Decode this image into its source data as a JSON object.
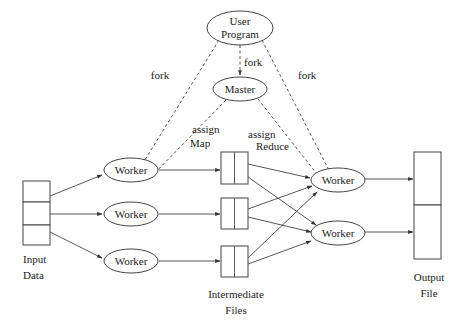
{
  "diagram": {
    "nodes": {
      "user_program": {
        "line1": "User",
        "line2": "Program"
      },
      "master": {
        "label": "Master"
      },
      "map_workers": [
        {
          "label": "Worker"
        },
        {
          "label": "Worker"
        },
        {
          "label": "Worker"
        }
      ],
      "reduce_workers": [
        {
          "label": "Worker"
        },
        {
          "label": "Worker"
        }
      ],
      "input": {
        "line1": "Input",
        "line2": "Data",
        "splits": 3
      },
      "intermediate": {
        "line1": "Intermediate",
        "line2": "Files",
        "files": 3,
        "partitions_per_file": 2
      },
      "output": {
        "line1": "Output",
        "line2": "File",
        "parts": 2
      }
    },
    "edge_labels": {
      "fork_left": "fork",
      "fork_center": "fork",
      "fork_right": "fork",
      "assign_map_1": "assign",
      "assign_map_2": "Map",
      "assign_reduce_1": "assign",
      "assign_reduce_2": "Reduce"
    },
    "edges": [
      {
        "from": "user_program",
        "to": "master",
        "style": "dashed",
        "label": "fork"
      },
      {
        "from": "user_program",
        "to": "map_worker_1",
        "style": "dashed",
        "label": "fork"
      },
      {
        "from": "user_program",
        "to": "reduce_worker_1",
        "style": "dashed",
        "label": "fork"
      },
      {
        "from": "master",
        "to": "map_worker_1",
        "style": "dashed",
        "label": "assign Map"
      },
      {
        "from": "master",
        "to": "reduce_worker_1",
        "style": "dashed",
        "label": "assign Reduce"
      },
      {
        "from": "input_split_1",
        "to": "map_worker_1",
        "style": "solid"
      },
      {
        "from": "input_split_2",
        "to": "map_worker_2",
        "style": "solid"
      },
      {
        "from": "input_split_3",
        "to": "map_worker_3",
        "style": "solid"
      },
      {
        "from": "map_worker_1",
        "to": "intermediate_1",
        "style": "solid"
      },
      {
        "from": "map_worker_2",
        "to": "intermediate_2",
        "style": "solid"
      },
      {
        "from": "map_worker_3",
        "to": "intermediate_3",
        "style": "solid"
      },
      {
        "from": "intermediate_1",
        "to": "reduce_worker_1",
        "style": "solid"
      },
      {
        "from": "intermediate_1",
        "to": "reduce_worker_2",
        "style": "solid"
      },
      {
        "from": "intermediate_2",
        "to": "reduce_worker_1",
        "style": "solid"
      },
      {
        "from": "intermediate_2",
        "to": "reduce_worker_2",
        "style": "solid"
      },
      {
        "from": "intermediate_3",
        "to": "reduce_worker_1",
        "style": "solid"
      },
      {
        "from": "intermediate_3",
        "to": "reduce_worker_2",
        "style": "solid"
      },
      {
        "from": "reduce_worker_1",
        "to": "output_part_1",
        "style": "solid"
      },
      {
        "from": "reduce_worker_2",
        "to": "output_part_2",
        "style": "solid"
      }
    ],
    "colors": {
      "stroke": "#444444",
      "text": "#222222",
      "background": "#ffffff"
    }
  }
}
